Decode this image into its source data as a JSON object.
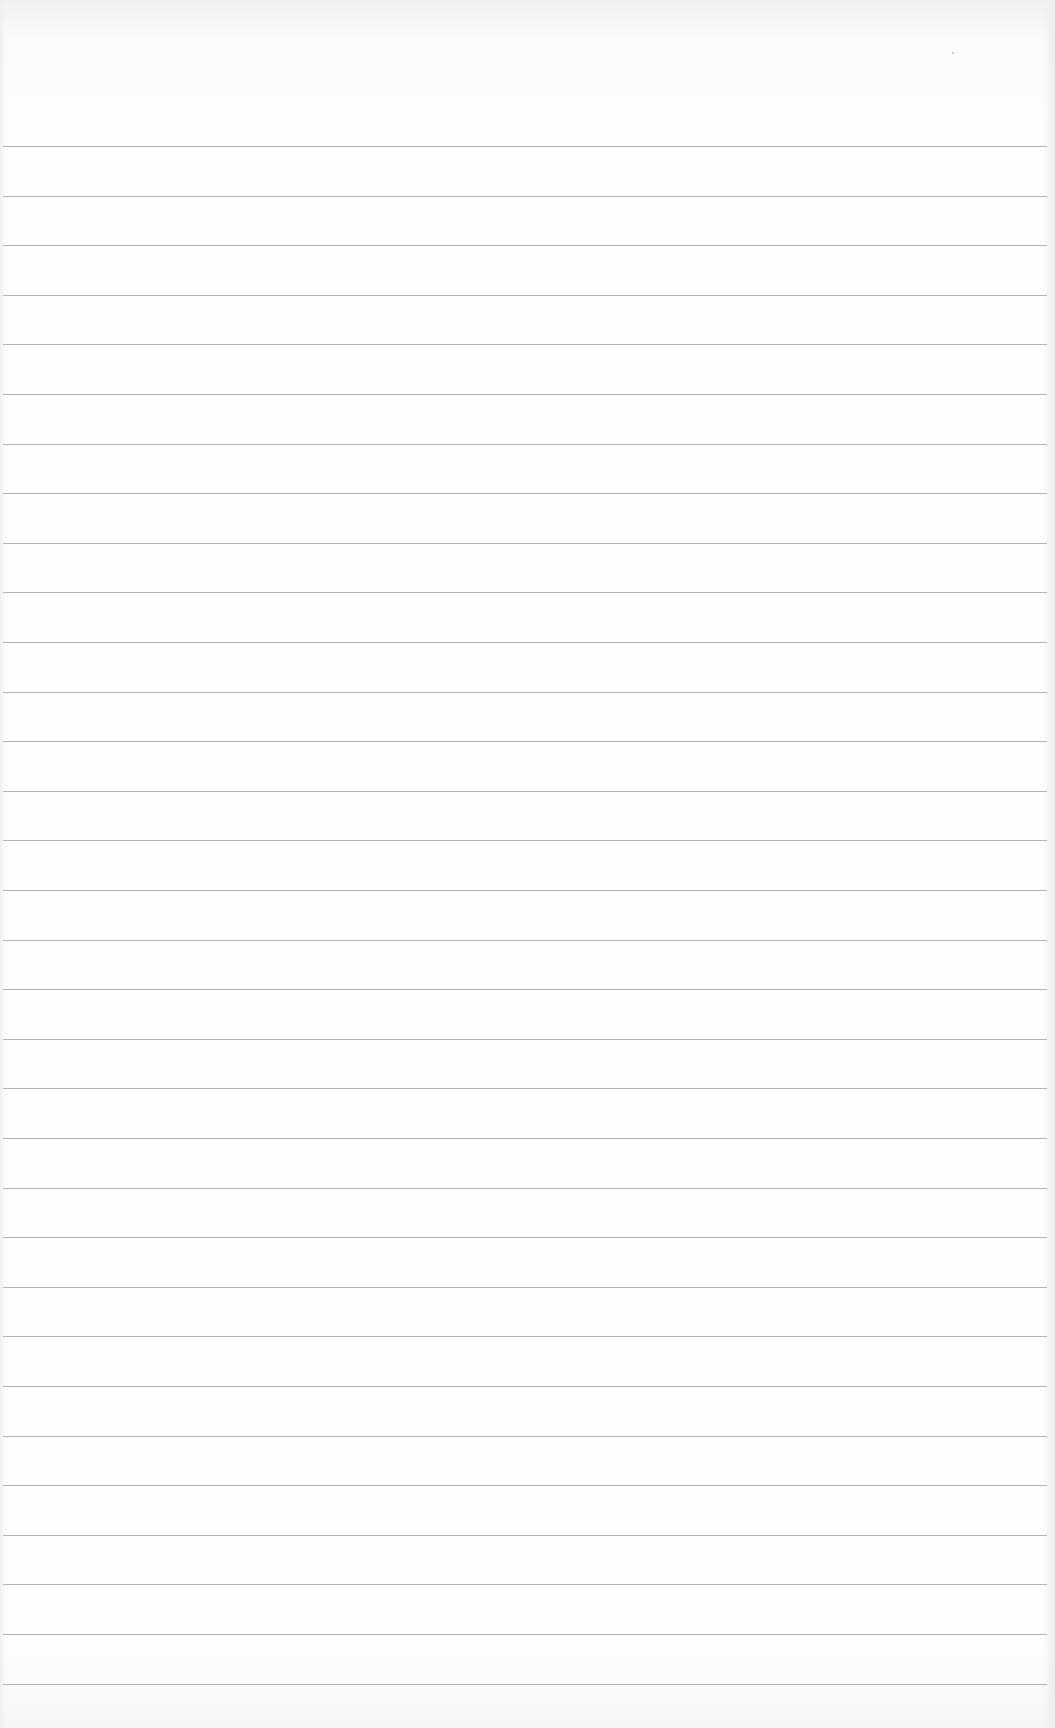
{
  "page": {
    "type": "blank lined paper",
    "background_color": "#fcfcfc",
    "rule_color": "#9a9a9a",
    "rule_count": 32,
    "first_rule_y": 146,
    "rule_spacing": 49.6
  }
}
